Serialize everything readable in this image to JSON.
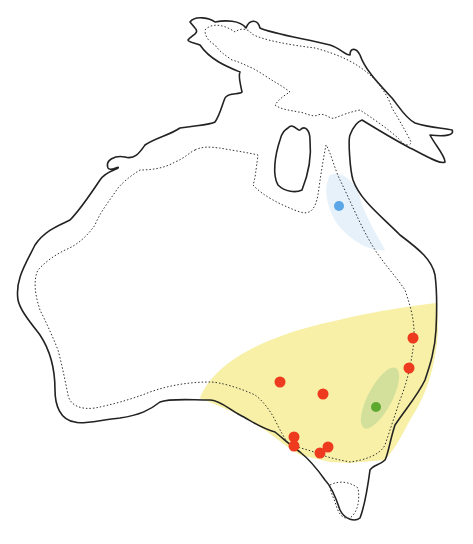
{
  "map": {
    "title": "",
    "region": "Sahul (Australia, New Guinea, Tasmania)",
    "colors": {
      "coastline": "#222222",
      "modern_coast_dotted": "#333333",
      "yellow_range": "#f6ee9c",
      "blue_range": "#e3f0fa",
      "green_range": "#c9dc9a",
      "red_site": "#ee3a1e",
      "blue_site": "#5aa6e6",
      "green_site": "#5da82e"
    },
    "sites": {
      "red": [
        {
          "x": 413,
          "y": 338
        },
        {
          "x": 409,
          "y": 368
        },
        {
          "x": 280,
          "y": 382
        },
        {
          "x": 323,
          "y": 394
        },
        {
          "x": 294,
          "y": 437
        },
        {
          "x": 294,
          "y": 446
        },
        {
          "x": 328,
          "y": 447
        },
        {
          "x": 320,
          "y": 453
        }
      ],
      "blue": [
        {
          "x": 339,
          "y": 206
        }
      ],
      "green": [
        {
          "x": 376,
          "y": 407
        }
      ]
    },
    "legend": []
  }
}
